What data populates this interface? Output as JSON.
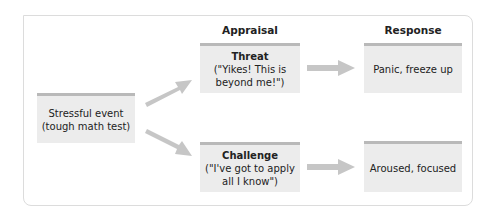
{
  "headers": {
    "appraisal": "Appraisal",
    "response": "Response"
  },
  "stimulus": {
    "line1": "Stressful event",
    "line2": "(tough math test)"
  },
  "appraisals": [
    {
      "title": "Threat",
      "line1": "(\"Yikes! This is",
      "line2": "beyond me!\")"
    },
    {
      "title": "Challenge",
      "line1": "(\"I've got to apply",
      "line2": "all I know\")"
    }
  ],
  "responses": [
    {
      "label": "Panic, freeze up"
    },
    {
      "label": "Aroused, focused"
    }
  ],
  "colors": {
    "box_fill": "#ececec",
    "box_top_bar": "#b9b9b9",
    "arrow": "#c6c6c6",
    "frame": "#dcdcdc"
  }
}
